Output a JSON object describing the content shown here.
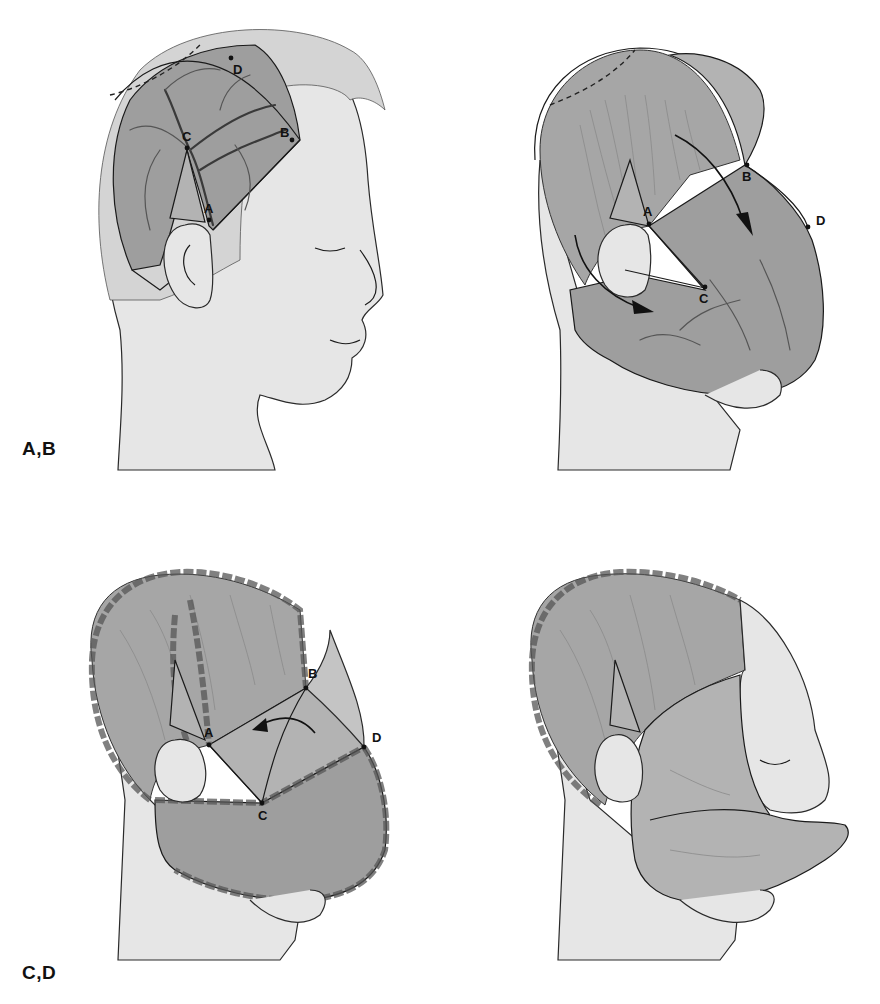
{
  "figure": {
    "background": "#ffffff",
    "colors": {
      "skin": "#e6e6e6",
      "flap": "#9e9e9e",
      "outline": "#1a1a1a",
      "label": "#111111"
    },
    "panels": [
      {
        "id": "A",
        "description": "Head in profile with scalp flap outlined over temporoparietal scalp; vessels drawn; dashed line at vertex",
        "points": [
          {
            "label": "A",
            "x": 209,
            "y": 218
          },
          {
            "label": "B",
            "x": 292,
            "y": 140
          },
          {
            "label": "C",
            "x": 187,
            "y": 148
          },
          {
            "label": "D",
            "x": 231,
            "y": 58
          }
        ]
      },
      {
        "id": "B",
        "description": "Flap elevated and rotated anteriorly over the face; arrows show direction of rotation",
        "points": [
          {
            "label": "A",
            "x": 649,
            "y": 224
          },
          {
            "label": "B",
            "x": 747,
            "y": 165
          },
          {
            "label": "C",
            "x": 705,
            "y": 287
          },
          {
            "label": "D",
            "x": 808,
            "y": 227
          }
        ]
      },
      {
        "id": "C",
        "description": "Flap inset with sutures around margins; curved arrow indicates advancement",
        "points": [
          {
            "label": "A",
            "x": 209,
            "y": 745
          },
          {
            "label": "B",
            "x": 306,
            "y": 688
          },
          {
            "label": "C",
            "x": 262,
            "y": 803
          },
          {
            "label": "D",
            "x": 364,
            "y": 747
          }
        ]
      },
      {
        "id": "D",
        "description": "Final result with flap tubed and inset to form lower face/lip; donor site sutured",
        "points": []
      }
    ],
    "panel_labels": [
      {
        "text": "A,B",
        "x": 22,
        "y": 440
      },
      {
        "text": "C,D",
        "x": 22,
        "y": 966
      }
    ]
  }
}
